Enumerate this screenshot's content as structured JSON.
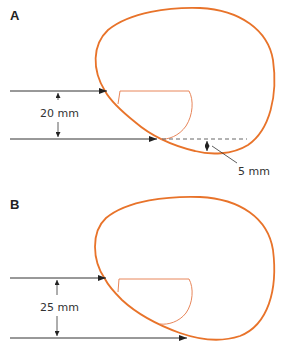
{
  "colors": {
    "outline": "#e8732a",
    "cup": "#e8865a",
    "line": "#333333"
  },
  "panels": [
    {
      "label": "A",
      "distance_label": "20 mm",
      "offset_label": "5 mm"
    },
    {
      "label": "B",
      "distance_label": "25 mm"
    }
  ]
}
